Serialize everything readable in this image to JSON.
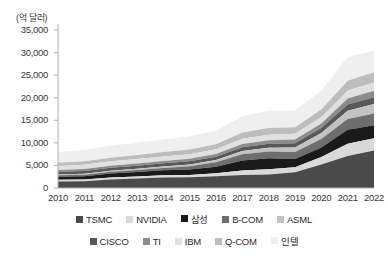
{
  "chart_data": {
    "type": "area",
    "stacked": true,
    "title": "",
    "subtitle": "",
    "unit_label": "(억 달러)",
    "xlabel": "",
    "ylabel": "",
    "grid": false,
    "legend_position": "bottom",
    "ylim": [
      0,
      35000
    ],
    "yticks": [
      0,
      5000,
      10000,
      15000,
      20000,
      25000,
      30000,
      35000
    ],
    "ytick_labels": [
      "0",
      "5,000",
      "10,000",
      "15,000",
      "20,000",
      "25,000",
      "30,000",
      "35,000"
    ],
    "categories": [
      2010,
      2011,
      2012,
      2013,
      2014,
      2015,
      2016,
      2017,
      2018,
      2019,
      2020,
      2021,
      2022
    ],
    "xtick_labels": [
      "2010",
      "2011",
      "2012",
      "2013",
      "2014",
      "2015",
      "2016",
      "2017",
      "2018",
      "2019",
      "2020",
      "2021",
      "2022"
    ],
    "series": [
      {
        "name": "TSMC",
        "color": "#4a4a4a",
        "values": [
          1450,
          1500,
          1900,
          2100,
          2350,
          2400,
          2600,
          2900,
          3000,
          3500,
          5200,
          7100,
          8300
        ]
      },
      {
        "name": "NVIDIA",
        "color": "#d9d9d9",
        "values": [
          350,
          370,
          400,
          420,
          460,
          500,
          680,
          980,
          1170,
          1100,
          1670,
          2690,
          2700
        ]
      },
      {
        "name": "삼성",
        "color": "#1a1a1a",
        "values": [
          700,
          750,
          900,
          1000,
          1100,
          1200,
          1400,
          2200,
          2400,
          1800,
          2100,
          3100,
          2900
        ]
      },
      {
        "name": "B-COM",
        "color": "#6e6e6e",
        "values": [
          300,
          330,
          380,
          450,
          520,
          700,
          1000,
          1400,
          1500,
          1600,
          1900,
          2400,
          2600
        ]
      },
      {
        "name": "ASML",
        "color": "#c2c2c2",
        "values": [
          200,
          220,
          260,
          300,
          340,
          420,
          520,
          720,
          850,
          980,
          1300,
          1800,
          2100
        ]
      },
      {
        "name": "CISCO",
        "color": "#585858",
        "values": [
          600,
          620,
          650,
          680,
          700,
          720,
          750,
          850,
          900,
          950,
          1100,
          1400,
          1500
        ]
      },
      {
        "name": "TI",
        "color": "#8c8c8c",
        "values": [
          400,
          420,
          450,
          480,
          510,
          540,
          580,
          700,
          780,
          820,
          1000,
          1350,
          1450
        ]
      },
      {
        "name": "IBM",
        "color": "#e0e0e0",
        "values": [
          900,
          930,
          960,
          980,
          1000,
          1020,
          1050,
          1150,
          1200,
          1250,
          1400,
          1700,
          1800
        ]
      },
      {
        "name": "Q-COM",
        "color": "#bdbdbd",
        "values": [
          700,
          760,
          820,
          900,
          980,
          1050,
          1120,
          1400,
          1500,
          1450,
          1700,
          2200,
          2300
        ]
      },
      {
        "name": "인텔",
        "color": "#efefef",
        "values": [
          2400,
          2500,
          2650,
          2700,
          2800,
          2900,
          3000,
          3600,
          3800,
          3700,
          4200,
          5200,
          4800
        ]
      }
    ]
  },
  "legend_rows": [
    [
      "TSMC",
      "NVIDIA",
      "삼성",
      "B-COM",
      "ASML"
    ],
    [
      "CISCO",
      "TI",
      "IBM",
      "Q-COM",
      "인텔"
    ]
  ]
}
